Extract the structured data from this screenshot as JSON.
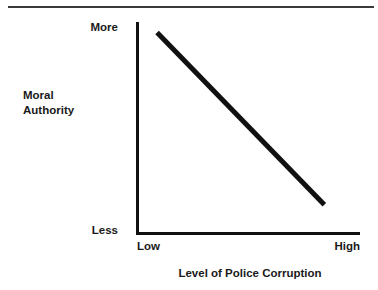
{
  "chart_data": {
    "type": "line",
    "title": "",
    "subtitle": "",
    "xlabel": "Level of Police Corruption",
    "ylabel": "Moral Authority",
    "ylabel_lines": [
      "Moral",
      "Authority"
    ],
    "x_tick_labels": [
      "Low",
      "High"
    ],
    "y_tick_labels": [
      "Less",
      "More"
    ],
    "x_tick_low": "Low",
    "x_tick_high": "High",
    "y_tick_low": "Less",
    "y_tick_high": "More",
    "grid": false,
    "legend": null,
    "xlim": [
      0,
      1
    ],
    "ylim": [
      0,
      1
    ],
    "series": [
      {
        "name": "Moral Authority vs Police Corruption",
        "x": [
          0.09,
          0.84
        ],
        "y": [
          0.95,
          0.13
        ],
        "points": [
          {
            "x": 0.09,
            "y": 0.95
          },
          {
            "x": 0.84,
            "y": 0.13
          }
        ],
        "relationship": "negative",
        "color": "#111111",
        "line_width": 5
      }
    ],
    "annotations": []
  },
  "figure": {
    "background_color": "#ffffff",
    "axis_color": "#111111",
    "text_color": "#1a1a1a",
    "rule_color": "#3a3a3a"
  }
}
